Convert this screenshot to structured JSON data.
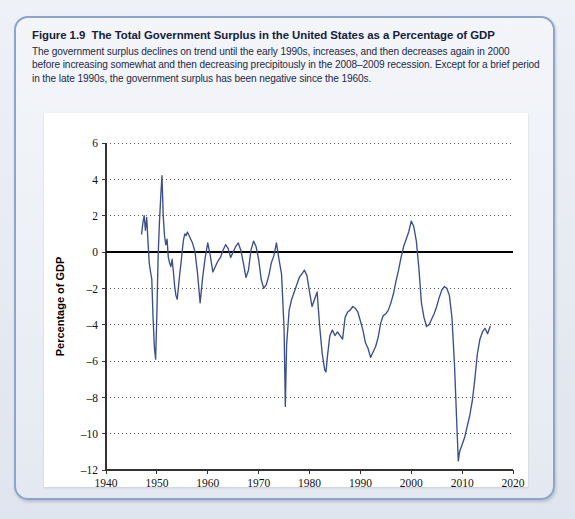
{
  "figure": {
    "number": "Figure 1.9",
    "title": "The Total Government Surplus in the United States as a Percentage of GDP",
    "caption": "The government surplus declines on trend until the early 1990s, increases, and then decreases again in 2000 before increasing somewhat and then decreasing precipitously in the 2008–2009 recession. Except for a brief period in the late 1990s, the government surplus has been negative since the 1960s."
  },
  "colors": {
    "line": "#3a4f8c",
    "zero_line": "#000000",
    "grid": "#555555",
    "axis": "#333333",
    "panel_border": "#8ea4c8",
    "page_background": "#e8ecf2",
    "plot_background": "#ffffff"
  },
  "chart_data": {
    "type": "line",
    "title": "",
    "xlabel": "Year",
    "ylabel": "Percentage of GDP",
    "xlim": [
      1940,
      2020
    ],
    "ylim": [
      -12,
      6
    ],
    "xticks": [
      1940,
      1950,
      1960,
      1970,
      1980,
      1990,
      2000,
      2010,
      2020
    ],
    "yticks": [
      6,
      4,
      2,
      0,
      -2,
      -4,
      -6,
      -8,
      -10,
      -12
    ],
    "grid": "horizontal-dotted",
    "legend": "none",
    "zero_reference_line": 0,
    "series": [
      {
        "name": "Total government surplus (% of GDP)",
        "x": [
          1947.0,
          1947.25,
          1947.5,
          1947.75,
          1948.0,
          1948.25,
          1948.5,
          1948.75,
          1949.0,
          1949.25,
          1949.5,
          1949.75,
          1950.0,
          1950.25,
          1950.5,
          1950.75,
          1951.0,
          1951.25,
          1951.5,
          1951.75,
          1952.0,
          1952.25,
          1952.5,
          1952.75,
          1953.0,
          1953.25,
          1953.5,
          1953.75,
          1954.0,
          1954.25,
          1954.5,
          1954.75,
          1955.0,
          1955.25,
          1955.5,
          1955.75,
          1956.0,
          1956.5,
          1957.0,
          1957.5,
          1958.0,
          1958.5,
          1959.0,
          1959.5,
          1960.0,
          1960.5,
          1961.0,
          1961.5,
          1962.0,
          1962.5,
          1963.0,
          1963.5,
          1964.0,
          1964.5,
          1965.0,
          1965.5,
          1966.0,
          1966.5,
          1967.0,
          1967.5,
          1968.0,
          1968.5,
          1969.0,
          1969.5,
          1970.0,
          1970.5,
          1971.0,
          1971.5,
          1972.0,
          1972.5,
          1973.0,
          1973.5,
          1974.0,
          1974.5,
          1975.0,
          1975.25,
          1975.5,
          1976.0,
          1976.5,
          1977.0,
          1977.5,
          1978.0,
          1978.5,
          1979.0,
          1979.5,
          1980.0,
          1980.5,
          1981.0,
          1981.5,
          1982.0,
          1982.5,
          1983.0,
          1983.25,
          1983.5,
          1984.0,
          1984.5,
          1985.0,
          1985.5,
          1986.0,
          1986.5,
          1987.0,
          1987.5,
          1988.0,
          1988.5,
          1989.0,
          1989.5,
          1990.0,
          1990.5,
          1991.0,
          1991.5,
          1992.0,
          1992.5,
          1993.0,
          1993.5,
          1994.0,
          1994.5,
          1995.0,
          1995.5,
          1996.0,
          1996.5,
          1997.0,
          1997.5,
          1998.0,
          1998.5,
          1999.0,
          1999.5,
          2000.0,
          2000.5,
          2001.0,
          2001.5,
          2002.0,
          2002.5,
          2003.0,
          2003.5,
          2004.0,
          2004.5,
          2005.0,
          2005.5,
          2006.0,
          2006.5,
          2007.0,
          2007.5,
          2008.0,
          2008.5,
          2009.0,
          2009.25,
          2009.5,
          2010.0,
          2010.5,
          2011.0,
          2011.5,
          2012.0,
          2012.5,
          2013.0,
          2013.5,
          2014.0,
          2014.5,
          2015.0,
          2015.5
        ],
        "y": [
          1.0,
          1.6,
          2.0,
          1.2,
          1.9,
          0.6,
          -0.6,
          -1.1,
          -1.5,
          -3.6,
          -5.2,
          -5.9,
          -3.4,
          -0.2,
          1.6,
          3.0,
          4.2,
          2.0,
          0.9,
          0.4,
          0.7,
          -0.3,
          -0.6,
          -0.8,
          -0.4,
          -1.1,
          -1.9,
          -2.4,
          -2.6,
          -1.9,
          -1.2,
          -0.6,
          0.1,
          0.7,
          1.0,
          0.9,
          1.1,
          0.8,
          0.5,
          0.0,
          -1.2,
          -2.8,
          -1.4,
          -0.3,
          0.5,
          -0.2,
          -1.1,
          -0.8,
          -0.5,
          -0.3,
          0.1,
          0.4,
          0.2,
          -0.3,
          0.0,
          0.3,
          0.5,
          0.1,
          -0.6,
          -1.4,
          -1.0,
          0.1,
          0.6,
          0.3,
          -0.4,
          -1.5,
          -2.0,
          -1.8,
          -1.3,
          -0.6,
          -0.2,
          0.5,
          -0.4,
          -1.2,
          -4.2,
          -8.5,
          -5.1,
          -3.2,
          -2.6,
          -2.2,
          -1.8,
          -1.4,
          -1.2,
          -1.0,
          -1.3,
          -2.2,
          -3.0,
          -2.6,
          -2.2,
          -4.1,
          -5.6,
          -6.5,
          -6.6,
          -5.8,
          -4.6,
          -4.3,
          -4.6,
          -4.4,
          -4.6,
          -4.8,
          -3.6,
          -3.3,
          -3.2,
          -3.0,
          -3.1,
          -3.3,
          -3.8,
          -4.3,
          -5.0,
          -5.3,
          -5.8,
          -5.5,
          -5.2,
          -4.7,
          -3.9,
          -3.5,
          -3.4,
          -3.2,
          -2.8,
          -2.3,
          -1.6,
          -1.0,
          -0.3,
          0.3,
          0.7,
          1.1,
          1.7,
          1.4,
          0.6,
          -0.9,
          -2.8,
          -3.6,
          -4.1,
          -4.0,
          -3.7,
          -3.4,
          -3.0,
          -2.5,
          -2.1,
          -1.9,
          -2.0,
          -2.4,
          -3.6,
          -6.2,
          -9.8,
          -11.5,
          -11.0,
          -10.6,
          -10.2,
          -9.6,
          -9.0,
          -8.2,
          -7.0,
          -5.6,
          -4.8,
          -4.4,
          -4.2,
          -4.5,
          -4.1
        ]
      }
    ]
  },
  "axis_text": {
    "y_labels": [
      "6",
      "4",
      "2",
      "0",
      "–2",
      "–4",
      "–6",
      "–8",
      "–10",
      "–12"
    ],
    "x_labels": [
      "1940",
      "1950",
      "1960",
      "1970",
      "1980",
      "1990",
      "2000",
      "2010",
      "2020"
    ],
    "x_title": "Year",
    "y_title": "Percentage of GDP"
  }
}
